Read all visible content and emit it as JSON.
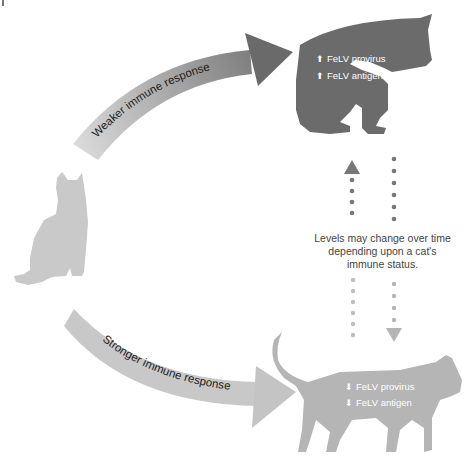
{
  "diagram": {
    "arrows": {
      "weaker": {
        "label": "Weaker immune response",
        "color_start": "#d8d8d8",
        "color_end": "#6e6e6e"
      },
      "stronger": {
        "label": "Stronger immune response",
        "color": "#c8c8c8"
      }
    },
    "cats": {
      "source": {
        "pose": "sitting",
        "color": "#c9c9c9"
      },
      "progressive": {
        "pose": "sitting-grooming",
        "color": "#6b6b6b",
        "labels": [
          {
            "icon": "arrow-up-icon",
            "glyph": "⬆",
            "text": "FeLV provirus"
          },
          {
            "icon": "arrow-up-icon",
            "glyph": "⬆",
            "text": "FeLV antigen"
          }
        ]
      },
      "regressive": {
        "pose": "walking",
        "color": "#b5b5b5",
        "labels": [
          {
            "icon": "arrow-down-icon",
            "glyph": "⬇",
            "text": "FeLV provirus"
          },
          {
            "icon": "arrow-down-icon",
            "glyph": "⬇",
            "text": "FeLV antigen"
          }
        ]
      }
    },
    "transition": {
      "caption_lines": [
        "Levels may change over time",
        "depending upon a cat's",
        "immune status."
      ],
      "up_arrow_color": "#777777",
      "down_arrow_color": "#b5b5b5"
    }
  }
}
